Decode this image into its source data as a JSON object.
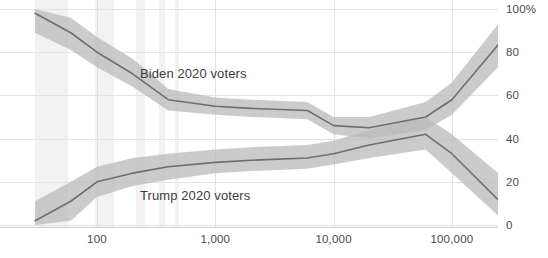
{
  "chart_data": {
    "type": "line",
    "title": "",
    "subtitle": "",
    "xlabel": "",
    "ylabel": "",
    "xscale": "log",
    "xlim": [
      30,
      300000
    ],
    "ylim": [
      0,
      100
    ],
    "grid": true,
    "legend_position": "inline-annotation",
    "y_ticks": [
      "0",
      "20",
      "40",
      "60",
      "80",
      "100%"
    ],
    "y_tick_values": [
      0,
      20,
      40,
      60,
      80,
      100
    ],
    "x_ticks": [
      "100",
      "1,000",
      "10,000",
      "100,000"
    ],
    "x_tick_values": [
      100,
      1000,
      10000,
      100000
    ],
    "annotations": [
      {
        "text": "Biden 2020 voters",
        "x": 600,
        "y": 68
      },
      {
        "text": "Trump 2020 voters",
        "x": 600,
        "y": 18
      }
    ],
    "series": [
      {
        "name": "Biden 2020 voters",
        "color": "#6e6e6e",
        "band_color": "#b9b9b9",
        "x": [
          30,
          60,
          100,
          200,
          400,
          1000,
          2000,
          6000,
          10000,
          20000,
          60000,
          100000,
          300000
        ],
        "values": [
          98,
          89,
          80,
          70,
          58,
          55,
          54,
          53,
          46,
          45,
          50,
          58,
          89
        ],
        "band_low": [
          89,
          81,
          73,
          64,
          53,
          51,
          50,
          49,
          42,
          40,
          44,
          51,
          78
        ],
        "band_high": [
          100,
          96,
          87,
          77,
          63,
          59,
          58,
          57,
          50,
          50,
          57,
          66,
          99
        ]
      },
      {
        "name": "Trump 2020 voters",
        "color": "#6e6e6e",
        "band_color": "#b9b9b9",
        "x": [
          30,
          60,
          100,
          200,
          400,
          1000,
          2000,
          6000,
          10000,
          20000,
          60000,
          100000,
          300000
        ],
        "values": [
          2,
          11,
          20,
          24,
          27,
          29,
          30,
          31,
          33,
          37,
          42,
          33,
          7
        ],
        "band_low": [
          0,
          2,
          13,
          18,
          21,
          24,
          25,
          26,
          28,
          31,
          35,
          24,
          0
        ],
        "band_high": [
          11,
          20,
          27,
          31,
          33,
          35,
          36,
          37,
          39,
          44,
          50,
          42,
          20
        ]
      }
    ],
    "background_bands": [
      {
        "from": 30,
        "to": 57,
        "shade": "light"
      },
      {
        "from": 97,
        "to": 138,
        "shade": "light"
      },
      {
        "from": 215,
        "to": 255,
        "shade": "light"
      },
      {
        "from": 333,
        "to": 373,
        "shade": "light"
      },
      {
        "from": 452,
        "to": 492,
        "shade": "light"
      }
    ],
    "colors": {
      "line": "#6e6e6e",
      "band": "#b9b9b9",
      "grid": "#e3e3e3",
      "vband": "#f2f2f2",
      "text": "#4a4a4a",
      "background": "#ffffff"
    }
  }
}
